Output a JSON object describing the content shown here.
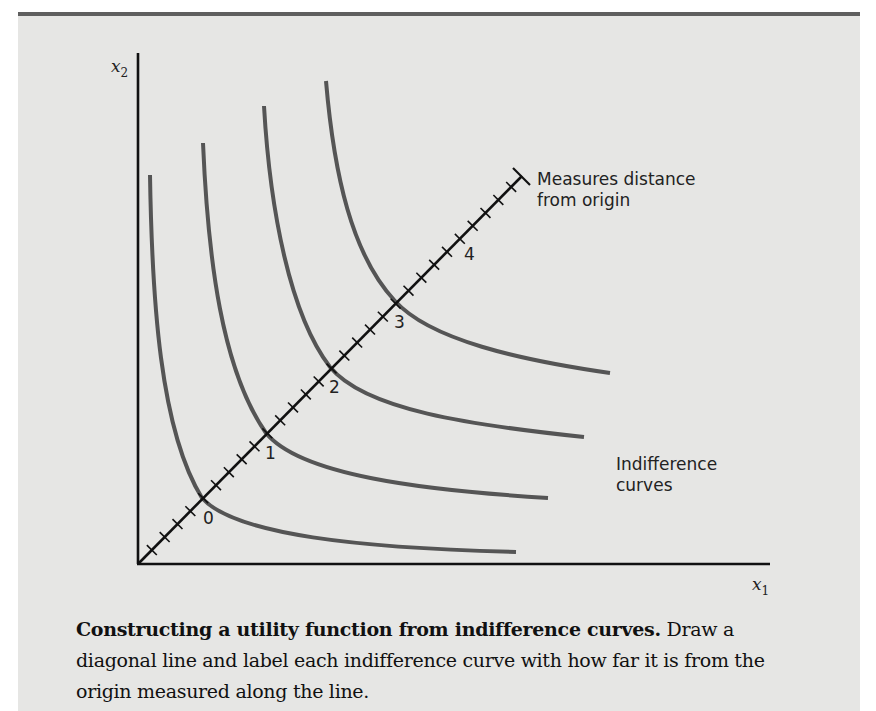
{
  "figure": {
    "axes": {
      "x_label": "x",
      "x_sub": "1",
      "y_label": "x",
      "y_sub": "2"
    },
    "diagonal_label_line1": "Measures distance",
    "diagonal_label_line2": "from origin",
    "curves_label_line1": "Indifference",
    "curves_label_line2": "curves",
    "curve_labels": [
      "0",
      "1",
      "2",
      "3",
      "4"
    ]
  },
  "caption": {
    "title": "Constructing a utility function from indifference curves.",
    "body": "Draw a diagonal line and label each indifference curve with how far it is from the origin measured along the line."
  },
  "colors": {
    "panel_bg": "#e6e6e4",
    "top_rule": "#5f5f5f",
    "curve": "#555555",
    "axis": "#111111"
  },
  "chart_data": {
    "type": "line",
    "title": "Constructing a utility function from indifference curves",
    "xlabel": "x1",
    "ylabel": "x2",
    "series": [
      {
        "name": "Indifference curve 0",
        "label": "0"
      },
      {
        "name": "Indifference curve 1",
        "label": "1"
      },
      {
        "name": "Indifference curve 2",
        "label": "2"
      },
      {
        "name": "Indifference curve 3",
        "label": "3"
      }
    ],
    "diagonal": {
      "description": "Measures distance from origin",
      "tick_labels": [
        "0",
        "1",
        "2",
        "3",
        "4"
      ],
      "minor_ticks_per_unit": 5
    },
    "annotations": [
      "Measures distance from origin",
      "Indifference curves"
    ],
    "grid": false
  }
}
